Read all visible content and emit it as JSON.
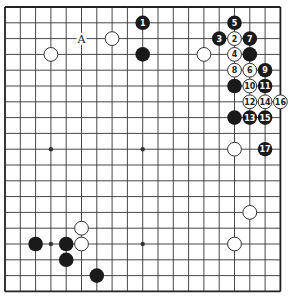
{
  "board": {
    "size": 19,
    "origin_x": 5,
    "origin_y": 7,
    "step_x": 15.3,
    "step_y": 15.8,
    "line_color": "#333333",
    "border_color": "#222222",
    "background": "#ffffff",
    "black_color": "#1a1a1a",
    "white_fill": "#ffffff",
    "white_stroke": "#333333"
  },
  "hoshi": [
    {
      "col": 3,
      "row": 9
    },
    {
      "col": 9,
      "row": 9
    },
    {
      "col": 3,
      "row": 15
    },
    {
      "col": 9,
      "row": 15
    },
    {
      "col": 3,
      "row": 3
    },
    {
      "col": 9,
      "row": 3
    },
    {
      "col": 15,
      "row": 3
    },
    {
      "col": 15,
      "row": 9
    },
    {
      "col": 15,
      "row": 15
    }
  ],
  "stones": [
    {
      "color": "black",
      "col": 9,
      "row": 1,
      "label": "1"
    },
    {
      "color": "white",
      "col": 15,
      "row": 2,
      "label": "2"
    },
    {
      "color": "black",
      "col": 14,
      "row": 2,
      "label": "3"
    },
    {
      "color": "white",
      "col": 15,
      "row": 3,
      "label": "4"
    },
    {
      "color": "black",
      "col": 15,
      "row": 1,
      "label": "5"
    },
    {
      "color": "white",
      "col": 16,
      "row": 4,
      "label": "6"
    },
    {
      "color": "black",
      "col": 16,
      "row": 2,
      "label": "7"
    },
    {
      "color": "white",
      "col": 15,
      "row": 4,
      "label": "8"
    },
    {
      "color": "black",
      "col": 17,
      "row": 4,
      "label": "9"
    },
    {
      "color": "white",
      "col": 16,
      "row": 5,
      "label": "10"
    },
    {
      "color": "black",
      "col": 17,
      "row": 5,
      "label": "11"
    },
    {
      "color": "white",
      "col": 16,
      "row": 6,
      "label": "12"
    },
    {
      "color": "black",
      "col": 16,
      "row": 7,
      "label": "13"
    },
    {
      "color": "white",
      "col": 17,
      "row": 6,
      "label": "14"
    },
    {
      "color": "black",
      "col": 17,
      "row": 7,
      "label": "15"
    },
    {
      "color": "white",
      "col": 18,
      "row": 6,
      "label": "16"
    },
    {
      "color": "black",
      "col": 17,
      "row": 9,
      "label": "17"
    },
    {
      "color": "black",
      "col": 9,
      "row": 3,
      "label": ""
    },
    {
      "color": "white",
      "col": 7,
      "row": 2,
      "label": ""
    },
    {
      "color": "white",
      "col": 3,
      "row": 3,
      "label": ""
    },
    {
      "color": "white",
      "col": 13,
      "row": 3,
      "label": ""
    },
    {
      "color": "black",
      "col": 16,
      "row": 3,
      "label": ""
    },
    {
      "color": "black",
      "col": 15,
      "row": 5,
      "label": ""
    },
    {
      "color": "black",
      "col": 15,
      "row": 7,
      "label": ""
    },
    {
      "color": "white",
      "col": 15,
      "row": 9,
      "label": ""
    },
    {
      "color": "white",
      "col": 16,
      "row": 13,
      "label": ""
    },
    {
      "color": "white",
      "col": 15,
      "row": 15,
      "label": ""
    },
    {
      "color": "white",
      "col": 5,
      "row": 14,
      "label": ""
    },
    {
      "color": "white",
      "col": 5,
      "row": 15,
      "label": ""
    },
    {
      "color": "black",
      "col": 2,
      "row": 15,
      "label": ""
    },
    {
      "color": "black",
      "col": 4,
      "row": 15,
      "label": ""
    },
    {
      "color": "black",
      "col": 4,
      "row": 16,
      "label": ""
    },
    {
      "color": "black",
      "col": 6,
      "row": 17,
      "label": ""
    }
  ],
  "marks": [
    {
      "col": 5,
      "row": 2,
      "label": "A"
    }
  ]
}
